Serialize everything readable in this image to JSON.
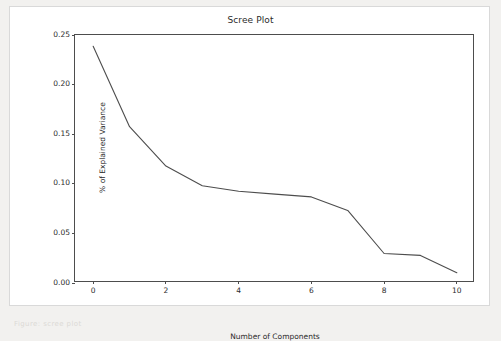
{
  "page": {
    "background_color": "#f2f1ef",
    "figure_background_color": "#ffffff",
    "footer_text": "Figure:  scree plot"
  },
  "chart_data": {
    "type": "line",
    "title": "Scree Plot",
    "xlabel": "Number of Components",
    "ylabel": "% of Explained Variance",
    "grid": false,
    "legend": false,
    "line_color": "#4d4d4d",
    "line_width": 1.1,
    "xlim": [
      -0.5,
      10.5
    ],
    "ylim": [
      -0.0075,
      0.2575
    ],
    "xticks": [
      0,
      2,
      4,
      6,
      8,
      10
    ],
    "xticklabels": [
      "0",
      "2",
      "4",
      "6",
      "8",
      "10"
    ],
    "yticks": [
      0.0,
      0.05,
      0.1,
      0.15,
      0.2,
      0.25
    ],
    "yticklabels": [
      "0.00",
      "0.05",
      "0.10",
      "0.15",
      "0.20",
      "0.25"
    ],
    "x": [
      0,
      1,
      2,
      3,
      4,
      5,
      6,
      7,
      8,
      9,
      10
    ],
    "values": [
      0.2455,
      0.1595,
      0.1175,
      0.0965,
      0.0905,
      0.0875,
      0.0845,
      0.07,
      0.024,
      0.022,
      0.0035
    ]
  }
}
